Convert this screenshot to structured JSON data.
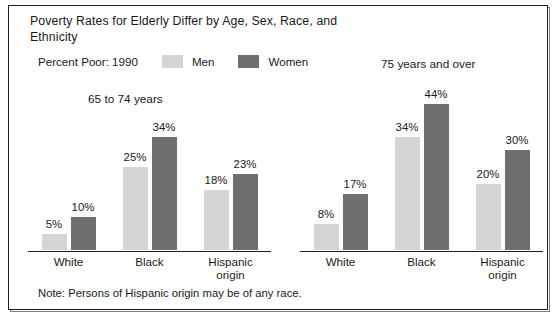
{
  "figure": {
    "title": "Poverty Rates for Elderly Differ by Age, Sex, Race, and Ethnicity",
    "percent_caption": "Percent Poor: 1990",
    "note": "Note: Persons of Hispanic origin may be of any race.",
    "legend": [
      {
        "label": "Men",
        "color": "#d5d5d5"
      },
      {
        "label": "Women",
        "color": "#6f6f6f"
      }
    ],
    "panels": [
      {
        "heading": "65 to 74 years"
      },
      {
        "heading": "75 years and over"
      }
    ]
  },
  "chart_data": [
    {
      "type": "bar",
      "title": "65 to 74 years",
      "subtitle": "Percent Poor: 1990",
      "categories": [
        "White",
        "Black",
        "Hispanic origin"
      ],
      "category_lines": [
        [
          "White"
        ],
        [
          "Black"
        ],
        [
          "Hispanic",
          "origin"
        ]
      ],
      "series": [
        {
          "name": "Men",
          "color": "#d5d5d5",
          "values": [
            5,
            25,
            18
          ],
          "labels": [
            "5%",
            "25%",
            "18%"
          ]
        },
        {
          "name": "Women",
          "color": "#6f6f6f",
          "values": [
            10,
            34,
            23
          ],
          "labels": [
            "10%",
            "34%",
            "23%"
          ]
        }
      ],
      "xlabel": "",
      "ylabel": "Percent Poor",
      "ylim": [
        0,
        45
      ],
      "grid": false,
      "legend_position": "top"
    },
    {
      "type": "bar",
      "title": "75 years and over",
      "subtitle": "Percent Poor: 1990",
      "categories": [
        "White",
        "Black",
        "Hispanic origin"
      ],
      "category_lines": [
        [
          "White"
        ],
        [
          "Black"
        ],
        [
          "Hispanic",
          "origin"
        ]
      ],
      "series": [
        {
          "name": "Men",
          "color": "#d5d5d5",
          "values": [
            8,
            34,
            20
          ],
          "labels": [
            "8%",
            "34%",
            "20%"
          ]
        },
        {
          "name": "Women",
          "color": "#6f6f6f",
          "values": [
            17,
            44,
            30
          ],
          "labels": [
            "17%",
            "44%",
            "30%"
          ]
        }
      ],
      "xlabel": "",
      "ylabel": "Percent Poor",
      "ylim": [
        0,
        45
      ],
      "grid": false,
      "legend_position": "top"
    }
  ]
}
